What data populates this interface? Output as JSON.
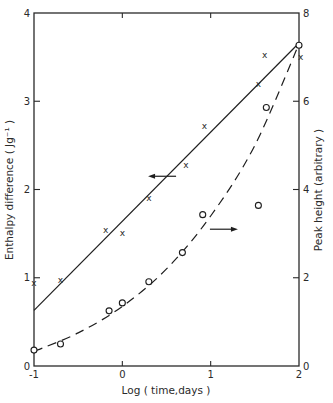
{
  "chart_data": {
    "type": "scatter",
    "title": "",
    "xlabel": "Log ( time,days )",
    "ylabel": "Enthalpy  difference ( Jg⁻¹ )",
    "ylabel_right": "Peak height  (arbitrary )",
    "xlim": [
      -1,
      2
    ],
    "ylim": [
      0,
      4
    ],
    "ylim_right": [
      0,
      8
    ],
    "x_ticks": [
      "-1",
      "0",
      "1",
      "2"
    ],
    "y_ticks": [
      "0",
      "1",
      "2",
      "3",
      "4"
    ],
    "y_ticks_right": [
      "0",
      "2",
      "4",
      "6",
      "8"
    ],
    "grid": false,
    "legend": "none (arrows indicate axis: left arrow near solid line, right arrow near dashed line)",
    "series": [
      {
        "name": "Enthalpy difference",
        "marker": "x",
        "axis": "left",
        "x": [
          -1.0,
          -0.7,
          -0.19,
          0.0,
          0.3,
          0.72,
          0.93,
          1.54,
          1.61,
          2.02
        ],
        "y": [
          0.94,
          0.97,
          1.54,
          1.51,
          1.9,
          2.28,
          2.72,
          3.19,
          3.52,
          3.5
        ]
      },
      {
        "name": "Enthalpy difference fit",
        "style": "solid line",
        "axis": "left",
        "x": [
          -1.0,
          2.0
        ],
        "y": [
          0.63,
          3.66
        ]
      },
      {
        "name": "Peak height",
        "marker": "o",
        "axis": "right",
        "x": [
          -1.0,
          -0.7,
          -0.15,
          0.0,
          0.3,
          0.68,
          0.91,
          1.54,
          1.63,
          2.0
        ],
        "y": [
          0.36,
          0.5,
          1.25,
          1.43,
          1.91,
          2.57,
          3.43,
          3.64,
          5.86,
          7.27
        ]
      },
      {
        "name": "Peak height fit",
        "style": "dashed curve",
        "axis": "right",
        "x": [
          -1.0,
          -0.5,
          0.0,
          0.5,
          1.0,
          1.5,
          2.0
        ],
        "y": [
          0.33,
          0.75,
          1.35,
          2.2,
          3.4,
          5.0,
          7.3
        ]
      }
    ],
    "annotations": [
      {
        "type": "arrow",
        "direction": "left",
        "x": 0.45,
        "y_left": 2.15,
        "meaning": "points to left axis (solid line)"
      },
      {
        "type": "arrow",
        "direction": "right",
        "x": 1.15,
        "y_right": 3.1,
        "meaning": "points to right axis (dashed line)"
      }
    ]
  }
}
